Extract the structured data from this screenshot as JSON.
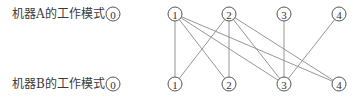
{
  "rows": {
    "a": {
      "label": "机器A的工作模式",
      "y": 14
    },
    "b": {
      "label": "机器B的工作模式",
      "y": 84
    }
  },
  "nodes": [
    {
      "id": "A0",
      "row": "a",
      "label": "0",
      "x": 113
    },
    {
      "id": "A1",
      "row": "a",
      "label": "1",
      "x": 175
    },
    {
      "id": "A2",
      "row": "a",
      "label": "2",
      "x": 229
    },
    {
      "id": "A3",
      "row": "a",
      "label": "3",
      "x": 284
    },
    {
      "id": "A4",
      "row": "a",
      "label": "4",
      "x": 339
    },
    {
      "id": "B0",
      "row": "b",
      "label": "0",
      "x": 113
    },
    {
      "id": "B1",
      "row": "b",
      "label": "1",
      "x": 175
    },
    {
      "id": "B2",
      "row": "b",
      "label": "2",
      "x": 229
    },
    {
      "id": "B3",
      "row": "b",
      "label": "3",
      "x": 284
    },
    {
      "id": "B4",
      "row": "b",
      "label": "4",
      "x": 339
    }
  ],
  "edges": [
    [
      "A1",
      "B1"
    ],
    [
      "A1",
      "B2"
    ],
    [
      "A1",
      "B3"
    ],
    [
      "A1",
      "B4"
    ],
    [
      "A2",
      "B1"
    ],
    [
      "A2",
      "B2"
    ],
    [
      "A2",
      "B3"
    ],
    [
      "A2",
      "B4"
    ],
    [
      "A3",
      "B3"
    ],
    [
      "A4",
      "B3"
    ]
  ],
  "style": {
    "node_radius": 7,
    "stroke_color": "#555555",
    "edge_color": "#8a8a8a"
  }
}
